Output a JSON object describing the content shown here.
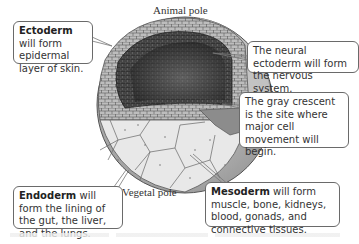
{
  "labels": {
    "animal_pole": "Animal pole",
    "vegetal_pole": "Vegetal pole"
  },
  "callouts": {
    "ectoderm": {
      "term": "Ectoderm",
      "text": " will form epidermal layer of skin."
    },
    "neural": {
      "text": "The neural ectoderm will form the nervous system."
    },
    "gray_crescent": {
      "text": "The gray crescent is the site where major cell movement will begin."
    },
    "endoderm": {
      "term": "Endoderm",
      "text": " will form the lining of the gut, the liver, and the lungs."
    },
    "mesoderm": {
      "term": "Mesoderm",
      "text": " will form muscle, bone, kidneys, blood, gonads, and connective tissues."
    }
  },
  "colors": {
    "ectoderm_cells": "#b8b8b8",
    "blastocoel": "#2a2a2a",
    "endoderm_cells": "#e8e8e8",
    "mesoderm_cells": "#8c8c8c",
    "gray_crescent": "#3a3a3a",
    "outline": "#555555"
  }
}
